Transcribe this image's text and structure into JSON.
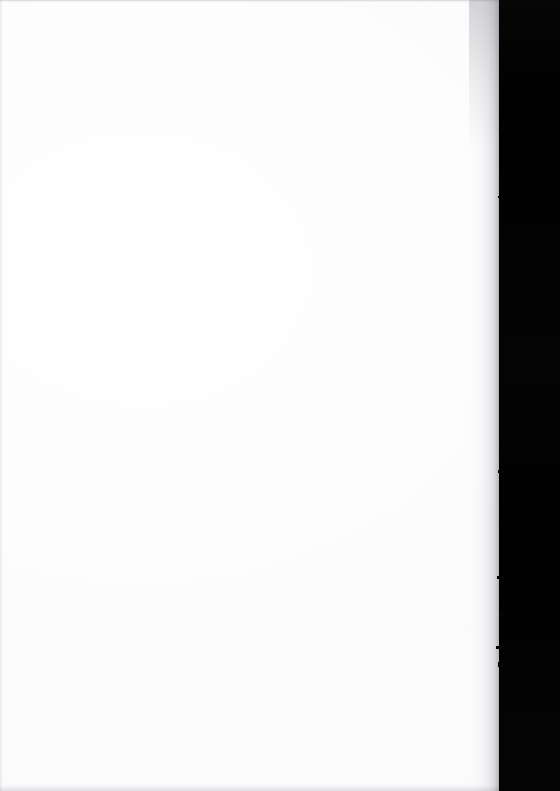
{
  "document": {
    "kind": "scanned-page",
    "page_content": "",
    "page_note": "blank page",
    "orientation": "portrait"
  },
  "canvas": {
    "width": 560,
    "height": 791
  },
  "page": {
    "left": 0,
    "top": 0,
    "width": 499,
    "height": 791,
    "paper_color": "#fefeff",
    "tone_color": "#fbfbfc"
  },
  "scanner_bed": {
    "color": "#010101",
    "edge_color": "#050505",
    "strip_left": 499,
    "strip_width": 61
  },
  "edges": {
    "top_line_color": "#787a82",
    "bottom_line_color": "#8c8e96",
    "left_line_color": "#9698a0",
    "right_shadow_color": "#464852"
  },
  "artifacts": {
    "speck_color": "#9696a5",
    "nicks": [
      {
        "top": 38,
        "width": 5,
        "height": 3
      },
      {
        "top": 128,
        "width": 4,
        "height": 2
      },
      {
        "top": 196,
        "width": 6,
        "height": 2
      },
      {
        "top": 262,
        "width": 4,
        "height": 3
      },
      {
        "top": 352,
        "width": 5,
        "height": 2
      },
      {
        "top": 420,
        "width": 3,
        "height": 2
      },
      {
        "top": 470,
        "width": 6,
        "height": 3
      },
      {
        "top": 524,
        "width": 4,
        "height": 2
      },
      {
        "top": 576,
        "width": 7,
        "height": 3
      },
      {
        "top": 612,
        "width": 5,
        "height": 4
      },
      {
        "top": 646,
        "width": 8,
        "height": 3
      },
      {
        "top": 662,
        "width": 6,
        "height": 5
      },
      {
        "top": 700,
        "width": 4,
        "height": 3
      },
      {
        "top": 742,
        "width": 5,
        "height": 2
      },
      {
        "top": 768,
        "width": 4,
        "height": 3
      }
    ]
  }
}
